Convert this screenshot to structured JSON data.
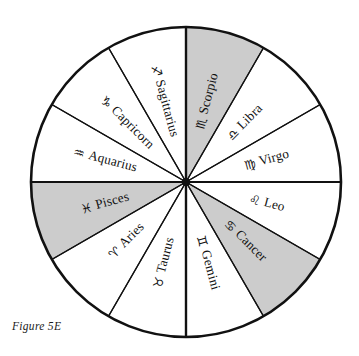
{
  "figure": {
    "caption": "Figure 5E",
    "background_color": "#ffffff",
    "line_color": "#111111",
    "shaded_color": "#cccccc",
    "unshaded_color": "#ffffff",
    "center_x": 186,
    "center_y": 182,
    "radius": 155
  },
  "chart_data": {
    "type": "pie",
    "title": "Figure 5E",
    "subtitle": "",
    "xlabel": "",
    "ylabel": "",
    "legend_position": "none",
    "grid": false,
    "equal_slices": true,
    "slice_count": 12,
    "slice_degrees": 30,
    "start_angle_deg": 90,
    "direction": "clockwise",
    "categories": [
      "Sagittarius",
      "Scorpio",
      "Libra",
      "Virgo",
      "Leo",
      "Cancer",
      "Gemini",
      "Taurus",
      "Aries",
      "Pisces",
      "Aquarius",
      "Capricorn"
    ],
    "values": [
      30,
      30,
      30,
      30,
      30,
      30,
      30,
      30,
      30,
      30,
      30,
      30
    ],
    "slices": [
      {
        "name": "Sagittarius",
        "glyph": "♐",
        "glyph_name": "sagittarius-symbol",
        "start_deg": 90,
        "end_deg": 120,
        "shaded": false,
        "fill": "#ffffff"
      },
      {
        "name": "Scorpio",
        "glyph": "♏",
        "glyph_name": "scorpio-symbol",
        "start_deg": 60,
        "end_deg": 90,
        "shaded": true,
        "fill": "#cccccc"
      },
      {
        "name": "Libra",
        "glyph": "♎",
        "glyph_name": "libra-symbol",
        "start_deg": 30,
        "end_deg": 60,
        "shaded": false,
        "fill": "#ffffff"
      },
      {
        "name": "Virgo",
        "glyph": "♍",
        "glyph_name": "virgo-symbol",
        "start_deg": 0,
        "end_deg": 30,
        "shaded": false,
        "fill": "#ffffff"
      },
      {
        "name": "Leo",
        "glyph": "♌",
        "glyph_name": "leo-symbol",
        "start_deg": -30,
        "end_deg": 0,
        "shaded": false,
        "fill": "#ffffff"
      },
      {
        "name": "Cancer",
        "glyph": "♋",
        "glyph_name": "cancer-symbol",
        "start_deg": -60,
        "end_deg": -30,
        "shaded": true,
        "fill": "#cccccc"
      },
      {
        "name": "Gemini",
        "glyph": "♊",
        "glyph_name": "gemini-symbol",
        "start_deg": -90,
        "end_deg": -60,
        "shaded": false,
        "fill": "#ffffff"
      },
      {
        "name": "Taurus",
        "glyph": "♉",
        "glyph_name": "taurus-symbol",
        "start_deg": -120,
        "end_deg": -90,
        "shaded": false,
        "fill": "#ffffff"
      },
      {
        "name": "Aries",
        "glyph": "♈",
        "glyph_name": "aries-symbol",
        "start_deg": -150,
        "end_deg": -120,
        "shaded": false,
        "fill": "#ffffff"
      },
      {
        "name": "Pisces",
        "glyph": "♓",
        "glyph_name": "pisces-symbol",
        "start_deg": 180,
        "end_deg": 210,
        "shaded": true,
        "fill": "#cccccc"
      },
      {
        "name": "Aquarius",
        "glyph": "♒",
        "glyph_name": "aquarius-symbol",
        "start_deg": 150,
        "end_deg": 180,
        "shaded": false,
        "fill": "#ffffff"
      },
      {
        "name": "Capricorn",
        "glyph": "♑",
        "glyph_name": "capricorn-symbol",
        "start_deg": 120,
        "end_deg": 150,
        "shaded": false,
        "fill": "#ffffff"
      }
    ]
  }
}
